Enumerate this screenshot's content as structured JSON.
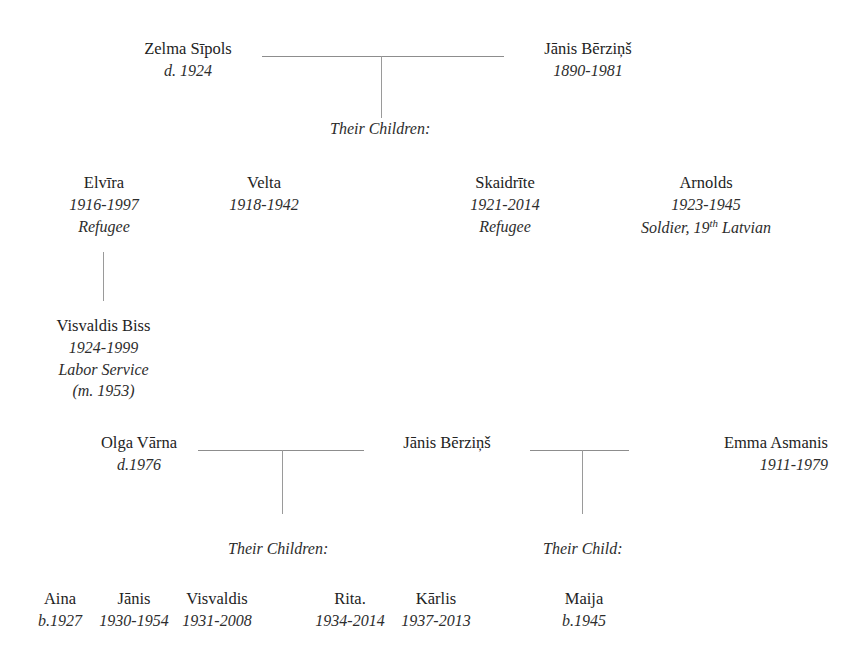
{
  "generation1": {
    "spouse_left": {
      "name": "Zelma Sīpols",
      "dates": "d. 1924"
    },
    "spouse_right": {
      "name": "Jānis Bērziņš",
      "dates": "1890-1981"
    },
    "children_label": "Their Children:"
  },
  "generation2": [
    {
      "name": "Elvīra",
      "dates": "1916-1997",
      "note": "Refugee"
    },
    {
      "name": "Velta",
      "dates": "1918-1942",
      "note": ""
    },
    {
      "name": "Skaidrīte",
      "dates": "1921-2014",
      "note": "Refugee"
    },
    {
      "name": "Arnolds",
      "dates": "1923-1945",
      "note_prefix": "Soldier, 19",
      "note_superscript": "th",
      "note_suffix": " Latvian"
    }
  ],
  "spouse_of_elvira": {
    "name": "Visvaldis Biss",
    "dates": "1924-1999",
    "note": "Labor Service",
    "marriage": "(m. 1953)"
  },
  "generation3": {
    "spouse_left": {
      "name": "Olga Vārna",
      "dates": "d.1976"
    },
    "spouse_center": {
      "name": "Jānis Bērziņš"
    },
    "spouse_right": {
      "name": "Emma Asmanis",
      "dates": "1911-1979"
    },
    "children_label_left": "Their Children:",
    "children_label_right": "Their Child:"
  },
  "generation4_left": [
    {
      "name": "Aina",
      "dates": "b.1927"
    },
    {
      "name": "Jānis",
      "dates": "1930-1954"
    },
    {
      "name": "Visvaldis",
      "dates": "1931-2008"
    },
    {
      "name": "Rita.",
      "dates": "1934-2014"
    },
    {
      "name": "Kārlis",
      "dates": "1937-2013"
    }
  ],
  "generation4_right": [
    {
      "name": "Maija",
      "dates": "b.1945"
    }
  ]
}
